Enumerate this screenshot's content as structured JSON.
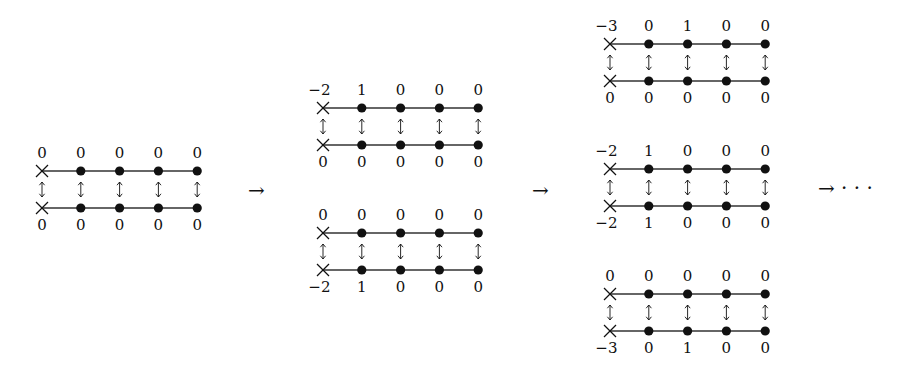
{
  "figure": {
    "columns": 5,
    "colors": {
      "ink": "#111111",
      "line": "#333333",
      "background": "#ffffff"
    },
    "stages": [
      {
        "name": "stage-1",
        "diagrams": [
          {
            "name": "diagram-initial",
            "origin": {
              "x": 42,
              "top_line_y": 171,
              "bottom_line_y": 208
            },
            "top_values": [
              "0",
              "0",
              "0",
              "0",
              "0"
            ],
            "bottom_values": [
              "0",
              "0",
              "0",
              "0",
              "0"
            ]
          }
        ]
      },
      {
        "name": "stage-2",
        "diagrams": [
          {
            "name": "diagram-2a",
            "origin": {
              "x": 323,
              "top_line_y": 108,
              "bottom_line_y": 145
            },
            "top_values": [
              "−2",
              "1",
              "0",
              "0",
              "0"
            ],
            "bottom_values": [
              "0",
              "0",
              "0",
              "0",
              "0"
            ]
          },
          {
            "name": "diagram-2b",
            "origin": {
              "x": 323,
              "top_line_y": 233,
              "bottom_line_y": 270
            },
            "top_values": [
              "0",
              "0",
              "0",
              "0",
              "0"
            ],
            "bottom_values": [
              "−2",
              "1",
              "0",
              "0",
              "0"
            ]
          }
        ]
      },
      {
        "name": "stage-3",
        "diagrams": [
          {
            "name": "diagram-3a",
            "origin": {
              "x": 610,
              "top_line_y": 44,
              "bottom_line_y": 81
            },
            "top_values": [
              "−3",
              "0",
              "1",
              "0",
              "0"
            ],
            "bottom_values": [
              "0",
              "0",
              "0",
              "0",
              "0"
            ]
          },
          {
            "name": "diagram-3b",
            "origin": {
              "x": 610,
              "top_line_y": 169,
              "bottom_line_y": 206
            },
            "top_values": [
              "−2",
              "1",
              "0",
              "0",
              "0"
            ],
            "bottom_values": [
              "−2",
              "1",
              "0",
              "0",
              "0"
            ]
          },
          {
            "name": "diagram-3c",
            "origin": {
              "x": 610,
              "top_line_y": 294,
              "bottom_line_y": 331
            },
            "top_values": [
              "0",
              "0",
              "0",
              "0",
              "0"
            ],
            "bottom_values": [
              "−3",
              "0",
              "1",
              "0",
              "0"
            ]
          }
        ]
      }
    ],
    "column_spacing": 38.8,
    "node_types": {
      "first": "cross-icon",
      "rest": "filled-dot"
    },
    "connector_glyph": "updown-arrow-icon",
    "transitions": [
      {
        "name": "arrow-1",
        "label": "→",
        "x": 248,
        "y": 190
      },
      {
        "name": "arrow-2",
        "label": "→",
        "x": 532,
        "y": 190
      },
      {
        "name": "arrow-3",
        "label": "→ · · ·",
        "x": 818,
        "y": 188
      }
    ]
  }
}
